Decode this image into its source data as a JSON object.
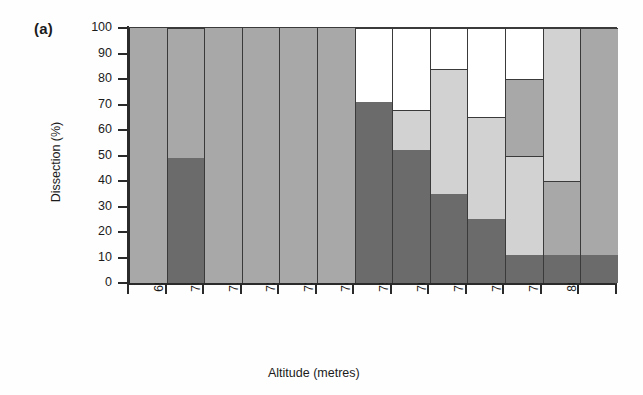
{
  "panel": {
    "label": "(a)"
  },
  "axes": {
    "ylabel": "Dissection (%)",
    "xlabel": "Altitude (metres)",
    "yticks": [
      "0",
      "10",
      "20",
      "30",
      "40",
      "50",
      "60",
      "70",
      "80",
      "90",
      "100"
    ],
    "ylim": [
      0,
      100
    ]
  },
  "colors": {
    "dark": "#6b6b6b",
    "medium": "#a8a8a8",
    "light": "#d2d2d2",
    "white": "#ffffff",
    "outline": "#3a3a3a",
    "axis": "#2a2a2a"
  },
  "chart_data": {
    "type": "bar",
    "title": "(a)",
    "xlabel": "Altitude (metres)",
    "ylabel": "Dissection (%)",
    "ylim": [
      0,
      100
    ],
    "grid": false,
    "legend": "none",
    "stacked": true,
    "categories": [
      "690–700",
      "700–710",
      "710–720",
      "720–730",
      "730–740",
      "740–750",
      "750–760",
      "760–770",
      "770–780",
      "780–790",
      "790–800",
      "800–810",
      ">810"
    ],
    "series": [
      {
        "name": "dark",
        "values": [
          0,
          49,
          0,
          0,
          0,
          0,
          71,
          52,
          35,
          25,
          11,
          11,
          11
        ]
      },
      {
        "name": "light",
        "values": [
          0,
          0,
          0,
          0,
          0,
          0,
          0,
          16,
          49,
          40,
          39,
          89,
          0
        ]
      },
      {
        "name": "medium",
        "values": [
          100,
          51,
          100,
          100,
          100,
          100,
          0,
          0,
          0,
          0,
          30,
          0,
          89
        ]
      },
      {
        "name": "white",
        "values": [
          0,
          0,
          0,
          0,
          0,
          0,
          29,
          32,
          16,
          35,
          20,
          0,
          0
        ]
      }
    ],
    "bars": [
      {
        "category": "690–700",
        "segments": [
          {
            "fill": "medium",
            "from": 0,
            "to": 100
          }
        ]
      },
      {
        "category": "700–710",
        "segments": [
          {
            "fill": "dark",
            "from": 0,
            "to": 49
          },
          {
            "fill": "medium",
            "from": 49,
            "to": 100
          }
        ]
      },
      {
        "category": "710–720",
        "segments": [
          {
            "fill": "medium",
            "from": 0,
            "to": 100
          }
        ]
      },
      {
        "category": "720–730",
        "segments": [
          {
            "fill": "medium",
            "from": 0,
            "to": 100
          }
        ]
      },
      {
        "category": "730–740",
        "segments": [
          {
            "fill": "medium",
            "from": 0,
            "to": 100
          }
        ]
      },
      {
        "category": "740–750",
        "segments": [
          {
            "fill": "medium",
            "from": 0,
            "to": 100
          }
        ]
      },
      {
        "category": "750–760",
        "segments": [
          {
            "fill": "dark",
            "from": 0,
            "to": 71
          },
          {
            "fill": "white",
            "from": 71,
            "to": 100
          }
        ]
      },
      {
        "category": "760–770",
        "segments": [
          {
            "fill": "dark",
            "from": 0,
            "to": 52
          },
          {
            "fill": "light",
            "from": 52,
            "to": 68
          },
          {
            "fill": "white",
            "from": 68,
            "to": 100
          }
        ]
      },
      {
        "category": "770–780",
        "segments": [
          {
            "fill": "dark",
            "from": 0,
            "to": 35
          },
          {
            "fill": "light",
            "from": 35,
            "to": 84
          },
          {
            "fill": "white",
            "from": 84,
            "to": 100
          }
        ]
      },
      {
        "category": "780–790",
        "segments": [
          {
            "fill": "dark",
            "from": 0,
            "to": 25
          },
          {
            "fill": "light",
            "from": 25,
            "to": 65
          },
          {
            "fill": "white",
            "from": 65,
            "to": 100
          }
        ]
      },
      {
        "category": "790–800",
        "segments": [
          {
            "fill": "dark",
            "from": 0,
            "to": 11
          },
          {
            "fill": "light",
            "from": 11,
            "to": 50
          },
          {
            "fill": "medium",
            "from": 50,
            "to": 80
          },
          {
            "fill": "white",
            "from": 80,
            "to": 100
          }
        ]
      },
      {
        "category": "800–810",
        "segments": [
          {
            "fill": "dark",
            "from": 0,
            "to": 11
          },
          {
            "fill": "medium",
            "from": 11,
            "to": 40
          },
          {
            "fill": "light",
            "from": 40,
            "to": 100
          }
        ]
      },
      {
        "category": ">810",
        "segments": [
          {
            "fill": "dark",
            "from": 0,
            "to": 11
          },
          {
            "fill": "medium",
            "from": 11,
            "to": 100
          }
        ]
      }
    ]
  }
}
